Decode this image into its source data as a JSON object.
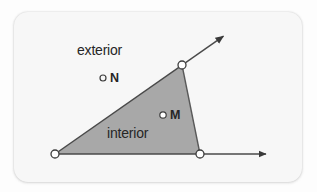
{
  "figure": {
    "type": "geometry-diagram",
    "canvas": {
      "width": 317,
      "height": 192
    },
    "card": {
      "x": 14,
      "y": 12,
      "width": 288,
      "height": 170,
      "fill": "#f7f7f7",
      "corner_radius": 14
    },
    "background_color": "#fdfdfd",
    "colors": {
      "shaded_region_fill": "#a8a8a8",
      "line_stroke": "#4a4a4a",
      "point_fill": "#ffffff",
      "point_stroke": "#3d3d3d",
      "text": "#262626"
    },
    "vertex": {
      "x": 55,
      "y": 154,
      "name": "angle-vertex"
    },
    "rays": [
      {
        "name": "horizontal-ray",
        "from": {
          "x": 55,
          "y": 154
        },
        "to": {
          "x": 272,
          "y": 154
        },
        "arrowhead": true
      },
      {
        "name": "diagonal-ray",
        "from": {
          "x": 55,
          "y": 154
        },
        "to": {
          "x": 229,
          "y": 32
        },
        "arrowhead": true
      }
    ],
    "shaded_triangle": {
      "name": "interior-shaded-region",
      "points": [
        {
          "x": 55,
          "y": 154
        },
        {
          "x": 182,
          "y": 65
        },
        {
          "x": 200,
          "y": 154
        }
      ],
      "closing_segment": {
        "from": {
          "x": 182,
          "y": 65
        },
        "to": {
          "x": 200,
          "y": 154
        }
      }
    },
    "ray_points": [
      {
        "name": "point-on-diagonal-ray",
        "x": 182,
        "y": 65,
        "r": 4
      },
      {
        "name": "point-on-horizontal-ray",
        "x": 200,
        "y": 154,
        "r": 4
      }
    ],
    "marked_points": [
      {
        "name": "point-N",
        "label": "N",
        "x": 103,
        "y": 78,
        "r": 3,
        "label_x": 110,
        "label_y": 72
      },
      {
        "name": "point-M",
        "label": "M",
        "x": 163,
        "y": 115,
        "r": 3.2,
        "label_x": 170,
        "label_y": 109
      }
    ],
    "labels": {
      "exterior": "exterior",
      "interior": "interior",
      "point_n": "N",
      "point_m": "M"
    }
  }
}
